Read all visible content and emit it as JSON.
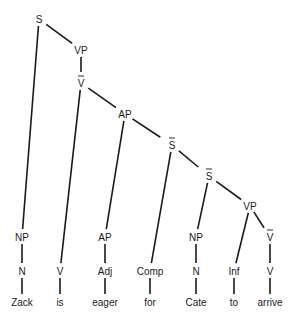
{
  "diagram": {
    "type": "syntax-tree",
    "nodes": [
      {
        "id": "S",
        "label": "S",
        "bar": false,
        "x": 39,
        "y": 19
      },
      {
        "id": "VP1",
        "label": "VP",
        "bar": false,
        "x": 81,
        "y": 50
      },
      {
        "id": "Vbar1",
        "label": "V",
        "bar": true,
        "x": 81,
        "y": 83
      },
      {
        "id": "AP1",
        "label": "AP",
        "bar": false,
        "x": 125,
        "y": 114
      },
      {
        "id": "Sbar",
        "label": "S",
        "bar": true,
        "x": 172,
        "y": 145
      },
      {
        "id": "S2",
        "label": "S",
        "bar": true,
        "x": 209,
        "y": 176
      },
      {
        "id": "VP2",
        "label": "VP",
        "bar": false,
        "x": 250,
        "y": 206
      },
      {
        "id": "NP1",
        "label": "NP",
        "bar": false,
        "x": 22,
        "y": 237
      },
      {
        "id": "N1",
        "label": "N",
        "bar": false,
        "x": 22,
        "y": 271
      },
      {
        "id": "Zack",
        "label": "Zack",
        "bar": false,
        "x": 22,
        "y": 302
      },
      {
        "id": "V1",
        "label": "V",
        "bar": false,
        "x": 60,
        "y": 271
      },
      {
        "id": "is",
        "label": "is",
        "bar": false,
        "x": 60,
        "y": 302
      },
      {
        "id": "AP2",
        "label": "AP",
        "bar": false,
        "x": 105,
        "y": 237
      },
      {
        "id": "Adj",
        "label": "Adj",
        "bar": false,
        "x": 105,
        "y": 271
      },
      {
        "id": "eager",
        "label": "eager",
        "bar": false,
        "x": 105,
        "y": 302
      },
      {
        "id": "Comp",
        "label": "Comp",
        "bar": false,
        "x": 150,
        "y": 271
      },
      {
        "id": "for",
        "label": "for",
        "bar": false,
        "x": 150,
        "y": 302
      },
      {
        "id": "NP2",
        "label": "NP",
        "bar": false,
        "x": 196,
        "y": 237
      },
      {
        "id": "N2",
        "label": "N",
        "bar": false,
        "x": 196,
        "y": 271
      },
      {
        "id": "Cate",
        "label": "Cate",
        "bar": false,
        "x": 196,
        "y": 302
      },
      {
        "id": "Inf",
        "label": "Inf",
        "bar": false,
        "x": 234,
        "y": 271
      },
      {
        "id": "to",
        "label": "to",
        "bar": false,
        "x": 234,
        "y": 302
      },
      {
        "id": "Vbar2",
        "label": "V",
        "bar": true,
        "x": 270,
        "y": 237
      },
      {
        "id": "V2",
        "label": "V",
        "bar": false,
        "x": 270,
        "y": 271
      },
      {
        "id": "arrive",
        "label": "arrive",
        "bar": false,
        "x": 270,
        "y": 302
      }
    ],
    "edges": [
      [
        "S",
        "VP1"
      ],
      [
        "S",
        "NP1"
      ],
      [
        "VP1",
        "Vbar1"
      ],
      [
        "Vbar1",
        "V1"
      ],
      [
        "Vbar1",
        "AP1"
      ],
      [
        "AP1",
        "AP2"
      ],
      [
        "AP1",
        "Sbar"
      ],
      [
        "Sbar",
        "Comp"
      ],
      [
        "Sbar",
        "S2"
      ],
      [
        "S2",
        "NP2"
      ],
      [
        "S2",
        "VP2"
      ],
      [
        "VP2",
        "Inf"
      ],
      [
        "VP2",
        "Vbar2"
      ],
      [
        "NP1",
        "N1"
      ],
      [
        "N1",
        "Zack"
      ],
      [
        "V1",
        "is"
      ],
      [
        "AP2",
        "Adj"
      ],
      [
        "Adj",
        "eager"
      ],
      [
        "Comp",
        "for"
      ],
      [
        "NP2",
        "N2"
      ],
      [
        "N2",
        "Cate"
      ],
      [
        "Inf",
        "to"
      ],
      [
        "Vbar2",
        "V2"
      ],
      [
        "V2",
        "arrive"
      ]
    ],
    "words": [
      "Zack",
      "is",
      "eager",
      "for",
      "Cate",
      "to",
      "arrive"
    ]
  }
}
